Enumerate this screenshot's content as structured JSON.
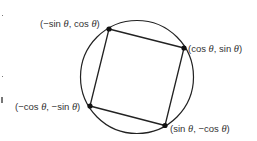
{
  "diagram": {
    "type": "square inscribed in unit circle",
    "colors": {
      "stroke": "#222222",
      "text": "#333333",
      "background": "#ffffff"
    },
    "circle": {
      "cx": 137,
      "cy": 77,
      "r": 56.5
    },
    "points": [
      {
        "id": "top-left",
        "x": 109,
        "y": 29,
        "label_parts": [
          "(−sin ",
          "θ",
          ", cos ",
          "θ",
          ")"
        ],
        "label": "(−sin θ, cos θ)"
      },
      {
        "id": "right",
        "x": 184,
        "y": 48,
        "label_parts": [
          "(cos ",
          "θ",
          ", sin ",
          "θ",
          ")"
        ],
        "label": "(cos θ, sin θ)"
      },
      {
        "id": "bottom-right",
        "x": 165,
        "y": 125.5,
        "label_parts": [
          "(sin ",
          "θ",
          ", −cos ",
          "θ",
          ")"
        ],
        "label": "(sin θ, −cos θ)"
      },
      {
        "id": "bottom-left",
        "x": 90,
        "y": 106,
        "label_parts": [
          "(−cos ",
          "θ",
          ", −sin ",
          "θ",
          ")"
        ],
        "label": "(−cos θ, −sin θ)"
      }
    ]
  }
}
